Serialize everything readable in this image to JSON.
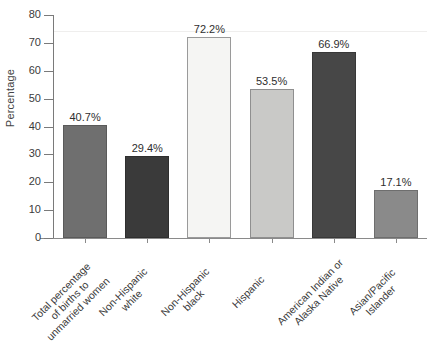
{
  "chart_data": {
    "type": "bar",
    "title": "",
    "xlabel": "",
    "ylabel": "Percentage",
    "ylim": [
      0,
      80
    ],
    "yticks": [
      0,
      10,
      20,
      30,
      40,
      50,
      60,
      70,
      80
    ],
    "grid": false,
    "legend": "none",
    "categories": [
      "Total percentage of births to unmarried women",
      "Non-Hispanic white",
      "Non-Hispanic black",
      "Hispanic",
      "American Indian or Alaska Native",
      "Asian/Pacific Islander"
    ],
    "category_lines": [
      [
        "Total percentage",
        "of births to",
        "unmarried women"
      ],
      [
        "Non-Hispanic",
        "white"
      ],
      [
        "Non-Hispanic",
        "black"
      ],
      [
        "Hispanic"
      ],
      [
        "American Indian or",
        "Alaska Native"
      ],
      [
        "Asian/Pacific",
        "Islander"
      ]
    ],
    "values": [
      40.7,
      29.4,
      72.2,
      53.5,
      66.9,
      17.1
    ],
    "data_labels": [
      "40.7%",
      "29.4%",
      "72.2%",
      "53.5%",
      "66.9%",
      "17.1%"
    ],
    "bar_colors": [
      "#6f6f6f",
      "#3a3a3a",
      "#f5f5f3",
      "#c9c9c7",
      "#474747",
      "#8a8a8a"
    ],
    "bar_borders": [
      "#5a5a5a",
      "#2e2e2e",
      "#9a9a9a",
      "#8f8f8f",
      "#383838",
      "#6e6e6e"
    ]
  },
  "axis": {
    "y_tick_labels": [
      "0",
      "10",
      "20",
      "30",
      "40",
      "50",
      "60",
      "70",
      "80"
    ],
    "y_title": "Percentage"
  }
}
